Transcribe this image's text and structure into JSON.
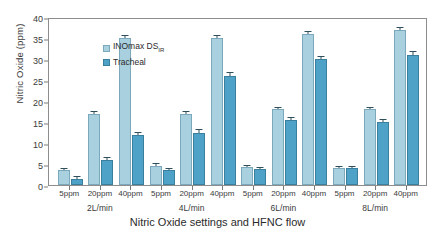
{
  "chart_data": {
    "type": "bar",
    "title": "",
    "xlabel": "Nitric Oxide settings and HFNC flow",
    "ylabel": "Nitric Oxide (ppm)",
    "ylim": [
      0,
      40
    ],
    "yticks": [
      0,
      5,
      10,
      15,
      20,
      25,
      30,
      35,
      40
    ],
    "grid": false,
    "legend_position": "top-left",
    "categories": [
      "5ppm",
      "20ppm",
      "40ppm",
      "5ppm",
      "20ppm",
      "40ppm",
      "5ppm",
      "20ppm",
      "40ppm",
      "5ppm",
      "20ppm",
      "40ppm"
    ],
    "groups": [
      {
        "label": "2L/min",
        "settings": [
          "5ppm",
          "20ppm",
          "40ppm"
        ]
      },
      {
        "label": "4L/min",
        "settings": [
          "5ppm",
          "20ppm",
          "40ppm"
        ]
      },
      {
        "label": "6L/min",
        "settings": [
          "5ppm",
          "20ppm",
          "40ppm"
        ]
      },
      {
        "label": "8L/min",
        "settings": [
          "5ppm",
          "20ppm",
          "40ppm"
        ]
      }
    ],
    "series": [
      {
        "name": "INOmax DS",
        "name_sub": "IR",
        "color": "#a9d0de",
        "values": [
          3.5,
          17.0,
          35.0,
          4.5,
          17.0,
          35.0,
          4.2,
          18.0,
          36.0,
          4.0,
          18.0,
          37.0
        ],
        "errors": [
          0.3,
          0.3,
          0.4,
          0.4,
          0.3,
          0.4,
          0.3,
          0.3,
          0.4,
          0.3,
          0.3,
          0.4
        ]
      },
      {
        "name": "Tracheal",
        "color": "#4ea2c7",
        "values": [
          1.5,
          6.0,
          12.0,
          3.5,
          12.5,
          26.0,
          3.8,
          15.5,
          30.0,
          4.0,
          15.0,
          31.0
        ],
        "errors": [
          0.3,
          0.4,
          0.5,
          0.4,
          0.5,
          0.6,
          0.3,
          0.5,
          0.5,
          0.3,
          0.5,
          0.6
        ]
      }
    ]
  },
  "legend": {
    "items": [
      {
        "label": "INOmax DS",
        "sublabel": "IR",
        "swatch": "light"
      },
      {
        "label": "Tracheal",
        "sublabel": "",
        "swatch": "dark"
      }
    ]
  },
  "axis": {
    "y_title": "Nitric Oxide (ppm)",
    "x_title": "Nitric Oxide settings and HFNC flow"
  }
}
